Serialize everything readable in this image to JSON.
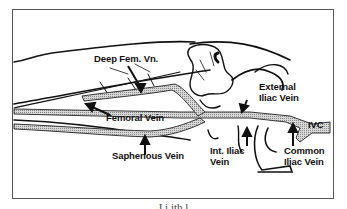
{
  "figure": {
    "labels": {
      "deep_femoral": "Deep Fem. Vn.",
      "external_iliac_line1": "External",
      "external_iliac_line2": "Iliac Vein",
      "femoral": "Femoral Vein",
      "saphenous": "Saphenous Vein",
      "internal_iliac_line1": "Int. Iliac",
      "internal_iliac_line2": "Vein",
      "ivc": "IVC",
      "common_iliac_line1": "Common",
      "common_iliac_line2": "Iliac Vein"
    },
    "caption": "I          i        ith     l"
  }
}
